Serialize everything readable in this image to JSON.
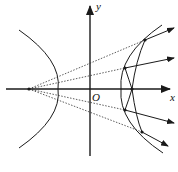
{
  "figure": {
    "type": "optics-geometry",
    "axes": {
      "x_label": "x",
      "y_label": "y",
      "origin_label": "O"
    },
    "colors": {
      "stroke": "#1a1a1a",
      "background": "#ffffff"
    },
    "elements": {
      "left_branch": "hyperbola-left-branch",
      "right_branch": "hyperbola-right-branch",
      "lens_curve": "inner-curve",
      "source_point": "left-focus",
      "dashed_rays": 4,
      "reflected_rays": 4
    }
  }
}
